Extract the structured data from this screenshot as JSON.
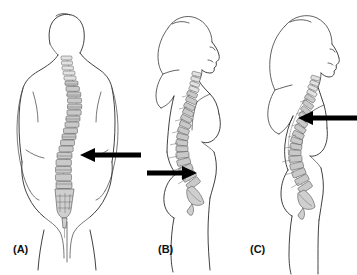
{
  "figure": {
    "background_color": "#ffffff",
    "width": 357,
    "height": 275,
    "panel_count": 3
  },
  "style": {
    "outline_color": "#2b2b2b",
    "vertebra_fill": "#c9c9c9",
    "vertebra_stroke": "#4d4d4d",
    "sacrum_fill": "#cfcfcf",
    "arrow_color": "#000000",
    "label_color": "#111111"
  },
  "panels": [
    {
      "id": "a",
      "label": "(A)",
      "view": "posterior",
      "subject": "standing figure seen from behind",
      "spine_feature": "lateral scoliotic curve of the vertebral column",
      "arrow": {
        "name": "arrow-panel-a",
        "direction": "left",
        "points_at": "lumbar spine convexity",
        "x_start": 140,
        "x_end": 80,
        "y": 155
      }
    },
    {
      "id": "b",
      "label": "(B)",
      "view": "lateral",
      "subject": "standing female figure seen from the side, facing right",
      "spine_feature": "increased lumbar lordosis",
      "arrow": {
        "name": "arrow-panel-b",
        "direction": "right",
        "points_at": "lumbosacral junction",
        "x_start": 148,
        "x_end": 196,
        "y": 173
      }
    },
    {
      "id": "c",
      "label": "(C)",
      "view": "lateral",
      "subject": "standing female figure seen from the side, facing right",
      "spine_feature": "increased thoracic kyphosis",
      "arrow": {
        "name": "arrow-panel-c",
        "direction": "left",
        "points_at": "thoracic spine apex",
        "x_start": 356,
        "x_end": 298,
        "y": 118
      }
    }
  ],
  "labels": {
    "a": "(A)",
    "b": "(B)",
    "c": "(C)"
  }
}
